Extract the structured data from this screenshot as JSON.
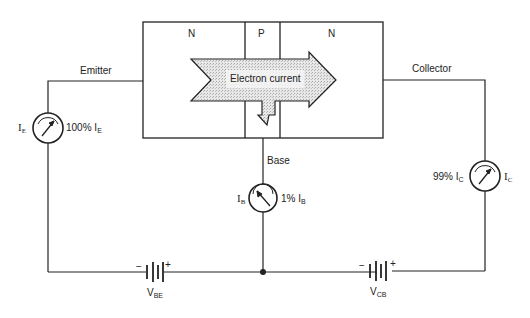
{
  "diagram": {
    "type": "NPN transistor current flow",
    "regions": [
      {
        "label": "N",
        "role": "emitter"
      },
      {
        "label": "P",
        "role": "base"
      },
      {
        "label": "N",
        "role": "collector"
      }
    ],
    "arrow_label": "Electron current",
    "terminals": {
      "emitter": "Emitter",
      "base": "Base",
      "collector": "Collector"
    },
    "meters": {
      "emitter": {
        "symbol": "I",
        "sub": "E",
        "pct_text": "100% I",
        "pct_sub": "E"
      },
      "base": {
        "symbol": "I",
        "sub": "B",
        "pct_text": "1% I",
        "pct_sub": "B"
      },
      "collector": {
        "symbol": "I",
        "sub": "C",
        "pct_text": "99% I",
        "pct_sub": "C"
      }
    },
    "batteries": {
      "vbe": {
        "label": "V",
        "sub": "BE",
        "minus": "−",
        "plus": "+"
      },
      "vcb": {
        "label": "V",
        "sub": "CB",
        "minus": "−",
        "plus": "+"
      }
    },
    "colors": {
      "line": "#222222",
      "arrow_fill": "#dcdcdc",
      "background": "#ffffff"
    }
  }
}
